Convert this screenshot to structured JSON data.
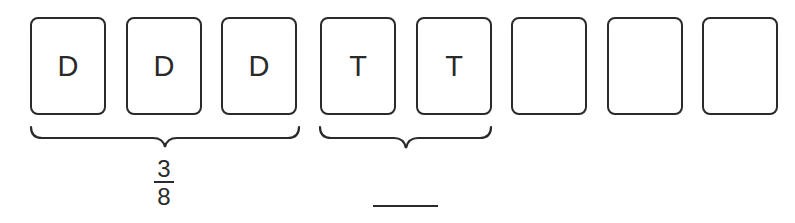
{
  "cards": [
    {
      "label": "D",
      "left": 30
    },
    {
      "label": "D",
      "left": 126
    },
    {
      "label": "D",
      "left": 221
    },
    {
      "label": "T",
      "left": 320
    },
    {
      "label": "T",
      "left": 416
    },
    {
      "label": "",
      "left": 511
    },
    {
      "label": "",
      "left": 607
    },
    {
      "label": "",
      "left": 702
    }
  ],
  "groups": [
    {
      "name": "D group",
      "covers_cards": 3,
      "fraction": {
        "numerator": "3",
        "denominator": "8"
      }
    },
    {
      "name": "T group",
      "covers_cards": 2,
      "fraction": {
        "numerator": "",
        "denominator": ""
      }
    }
  ],
  "answer_blank": ""
}
